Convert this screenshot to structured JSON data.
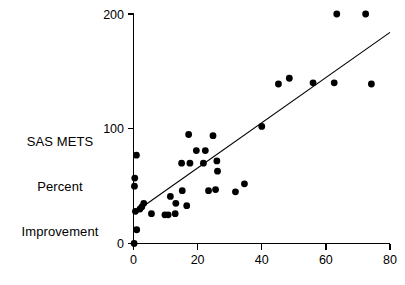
{
  "chart_data": {
    "type": "scatter",
    "title": "",
    "xlabel": "",
    "ylabel": "SAS METS Percent Improvement",
    "ylabel_lines": [
      "SAS METS",
      "Percent",
      "Improvement"
    ],
    "xlim": [
      0,
      80
    ],
    "ylim": [
      0,
      200
    ],
    "xticks": [
      0,
      20,
      40,
      60,
      80
    ],
    "xtick_labels": [
      "0",
      "20",
      "40",
      "60",
      "80"
    ],
    "yticks": [
      0,
      100,
      200
    ],
    "ytick_labels": [
      "0",
      "100",
      "200"
    ],
    "grid": false,
    "legend": null,
    "series": [
      {
        "name": "observations",
        "marker": "filled-circle",
        "color": "#000000",
        "points": [
          [
            0.2,
            0
          ],
          [
            1.0,
            12
          ],
          [
            0.6,
            28
          ],
          [
            0.3,
            50
          ],
          [
            0.4,
            57
          ],
          [
            0.9,
            77
          ],
          [
            2.0,
            30
          ],
          [
            2.6,
            32
          ],
          [
            3.2,
            35
          ],
          [
            5.6,
            26
          ],
          [
            9.8,
            25
          ],
          [
            10.8,
            25
          ],
          [
            13.0,
            26
          ],
          [
            11.5,
            41
          ],
          [
            13.2,
            35
          ],
          [
            15.2,
            46
          ],
          [
            15.0,
            70
          ],
          [
            16.6,
            33
          ],
          [
            17.2,
            95
          ],
          [
            17.6,
            70
          ],
          [
            19.6,
            81
          ],
          [
            22.4,
            81
          ],
          [
            21.8,
            70
          ],
          [
            24.8,
            94
          ],
          [
            23.4,
            46
          ],
          [
            26.0,
            72
          ],
          [
            26.2,
            63
          ],
          [
            25.6,
            47
          ],
          [
            31.8,
            45
          ],
          [
            34.6,
            52
          ],
          [
            40.0,
            102
          ],
          [
            45.2,
            139
          ],
          [
            48.6,
            144
          ],
          [
            56.0,
            140
          ],
          [
            62.6,
            140
          ],
          [
            63.4,
            200
          ],
          [
            72.4,
            200
          ],
          [
            74.2,
            139
          ]
        ]
      }
    ],
    "fit_line": {
      "name": "regression-line",
      "x0": 0.3,
      "y0": 27,
      "x1": 80.0,
      "y1": 184,
      "color": "#000000"
    }
  }
}
